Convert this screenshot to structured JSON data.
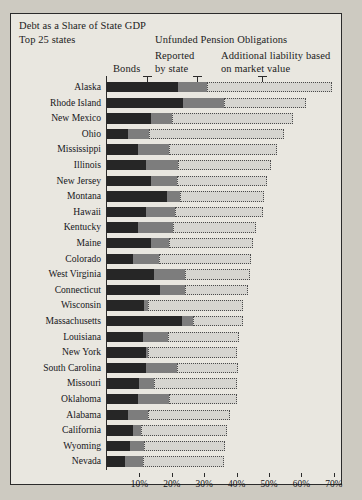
{
  "figure": {
    "title_line1": "Debt as a Share of State GDP",
    "title_line2": "Top 25 states",
    "group_header": "Unfunded Pension Obligations",
    "legend": {
      "bonds": "Bonds",
      "reported_line1": "Reported",
      "reported_line2": "by state",
      "market_line1": "Additional liability based",
      "market_line2": "on market value"
    },
    "colors": {
      "bonds": "#262626",
      "reported": "#7d7d7d",
      "market": "#d6d5d0",
      "frame": "#2b2b2b",
      "background": "#e9e7e0"
    }
  },
  "chart_data": {
    "type": "bar",
    "orientation": "horizontal",
    "stacked": true,
    "title": "Debt as a Share of State GDP",
    "subtitle": "Top 25 states",
    "xlabel": "",
    "ylabel": "",
    "xlim": [
      0,
      72
    ],
    "xticks": [
      10,
      20,
      30,
      40,
      50,
      60,
      70
    ],
    "xtick_labels": [
      "10%",
      "20%",
      "30%",
      "40%",
      "50%",
      "60%",
      "70%"
    ],
    "grid": false,
    "legend_position": "top",
    "series": [
      {
        "name": "Bonds",
        "color": "#262626",
        "values": [
          22.0,
          23.5,
          13.5,
          6.5,
          9.7,
          12.0,
          13.5,
          18.5,
          12.0,
          9.7,
          13.5,
          8.0,
          14.5,
          16.5,
          11.5,
          23.0,
          11.0,
          12.0,
          12.0,
          10.0,
          9.7,
          6.5,
          8.0,
          7.0,
          5.5
        ]
      },
      {
        "name": "Reported by state",
        "color": "#7d7d7d",
        "values": [
          9.0,
          12.5,
          6.5,
          6.5,
          9.3,
          10.0,
          8.0,
          4.0,
          9.0,
          10.7,
          5.5,
          8.0,
          9.5,
          7.5,
          1.2,
          3.4,
          7.7,
          0.7,
          9.5,
          4.5,
          9.3,
          6.2,
          2.5,
          4.5,
          5.5
        ]
      },
      {
        "name": "Additional liability based on market value",
        "color": "#d6d5d0",
        "values": [
          38.5,
          25.5,
          37.5,
          41.5,
          33.5,
          28.5,
          28.0,
          26.0,
          27.0,
          25.6,
          26.0,
          28.5,
          20.0,
          19.5,
          29.3,
          15.6,
          22.0,
          27.3,
          19.0,
          25.5,
          21.0,
          25.3,
          26.5,
          25.0,
          25.0
        ]
      }
    ],
    "categories": [
      "Alaska",
      "Rhode Island",
      "New Mexico",
      "Ohio",
      "Mississippi",
      "Illinois",
      "New Jersey",
      "Montana",
      "Hawaii",
      "Kentucky",
      "Maine",
      "Colorado",
      "West Virginia",
      "Connecticut",
      "Wisconsin",
      "Massachusetts",
      "Louisiana",
      "New York",
      "South Carolina",
      "Missouri",
      "Oklahoma",
      "Alabama",
      "California",
      "Wyoming",
      "Nevada"
    ],
    "totals": [
      69.5,
      61.5,
      57.5,
      54.5,
      52.5,
      50.5,
      49.5,
      48.5,
      48.0,
      46.0,
      45.0,
      44.5,
      44.0,
      43.5,
      42.0,
      42.0,
      40.7,
      40.0,
      40.5,
      40.0,
      40.0,
      38.0,
      37.0,
      36.5,
      36.0
    ]
  }
}
